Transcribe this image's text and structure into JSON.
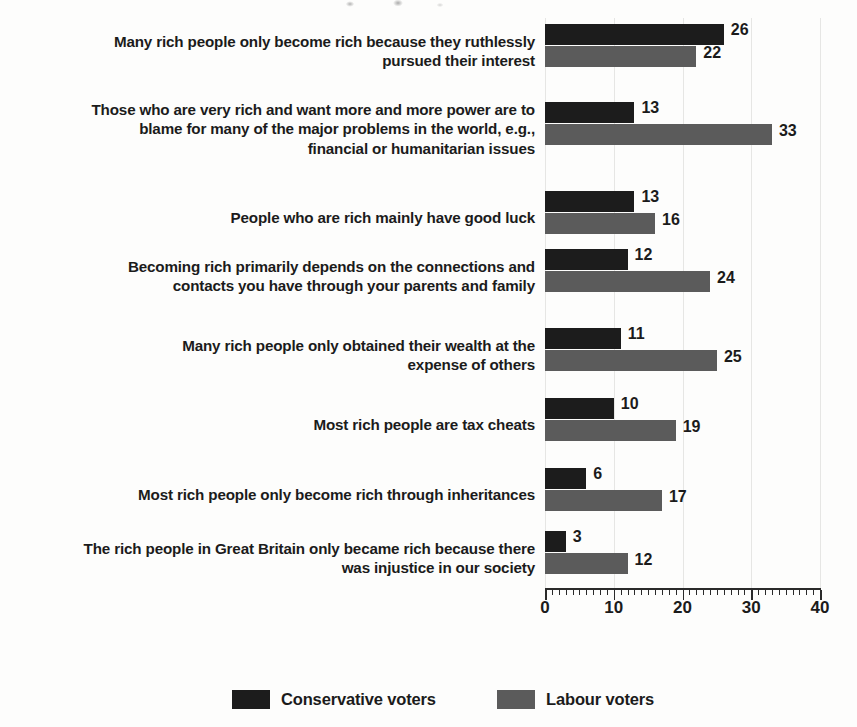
{
  "chart_data": {
    "type": "bar",
    "orientation": "horizontal",
    "title": "",
    "xlabel": "",
    "ylabel": "",
    "xlim": [
      0,
      40
    ],
    "xticks": [
      0,
      10,
      20,
      30,
      40
    ],
    "xtick_labels": [
      "0",
      "10",
      "20",
      "30",
      "40"
    ],
    "minor_tick_step": 1,
    "grid": true,
    "grid_axis": "x",
    "legend_position": "bottom",
    "categories": [
      "Many rich people only become rich because they ruthlessly\npursued their interest",
      "Those who are very rich and want more and more power are to\nblame for many of the major problems in the world, e.g.,\nfinancial or humanitarian issues",
      "People who are rich mainly have good luck",
      "Becoming rich primarily depends on the connections and\ncontacts you have through your parents and family",
      "Many rich people only obtained their wealth at the\nexpense of others",
      "Most rich people are tax cheats",
      "Most rich people only become rich through inheritances",
      "The rich people in Great Britain only became rich because there\nwas injustice in our society"
    ],
    "series": [
      {
        "name": "Conservative voters",
        "color": "#1c1c1c",
        "values": [
          26,
          13,
          13,
          12,
          11,
          10,
          6,
          3
        ]
      },
      {
        "name": "Labour voters",
        "color": "#5b5b5b",
        "values": [
          22,
          33,
          16,
          24,
          25,
          19,
          17,
          12
        ]
      }
    ]
  },
  "legend": {
    "items": [
      {
        "label": "Conservative voters",
        "color": "#1c1c1c"
      },
      {
        "label": "Labour voters",
        "color": "#5b5b5b"
      }
    ]
  }
}
